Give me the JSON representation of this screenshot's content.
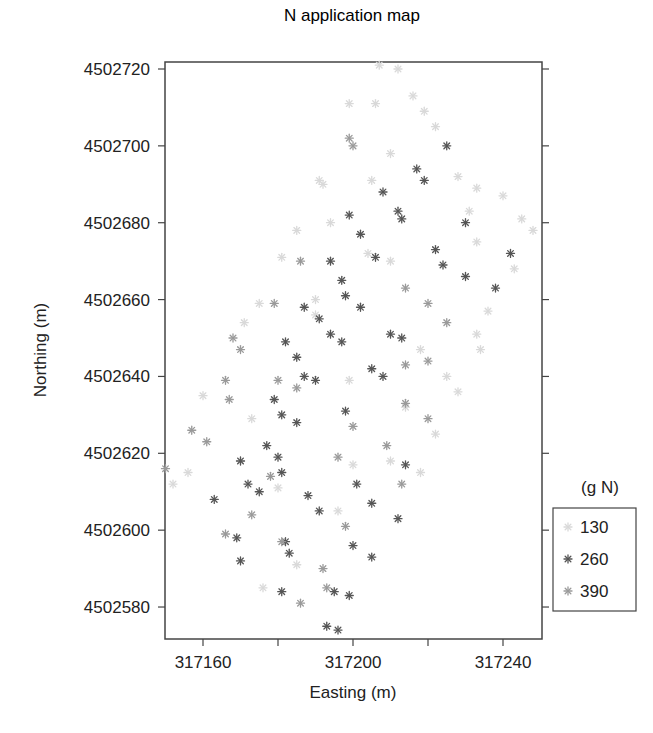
{
  "chart_data": {
    "type": "scatter",
    "title": "N application map",
    "xlabel": "Easting (m)",
    "ylabel": "Northing (m)",
    "xlim": [
      317150,
      317251
    ],
    "ylim": [
      4502572,
      4502722
    ],
    "xticks": [
      317160,
      317180,
      317200,
      317220,
      317240
    ],
    "xtick_labels": [
      "317160",
      "",
      "317200",
      "",
      "317240"
    ],
    "yticks": [
      4502580,
      4502600,
      4502620,
      4502640,
      4502660,
      4502680,
      4502700,
      4502720
    ],
    "ytick_labels": [
      "4502580",
      "4502600",
      "4502620",
      "4502640",
      "4502660",
      "4502680",
      "4502700",
      "4502720"
    ],
    "grid": false,
    "marker": "asterisk",
    "legend": {
      "title": "(g N)",
      "position": "right",
      "entries": [
        {
          "label": "130",
          "color": "#d9d9d9"
        },
        {
          "label": "260",
          "color": "#555555"
        },
        {
          "label": "390",
          "color": "#9a9a9a"
        }
      ]
    },
    "series": [
      {
        "name": "130",
        "color": "#d9d9d9",
        "points": [
          [
            317207,
            4502721
          ],
          [
            317212,
            4502720
          ],
          [
            317199,
            4502711
          ],
          [
            317206,
            4502711
          ],
          [
            317216,
            4502713
          ],
          [
            317219,
            4502709
          ],
          [
            317222,
            4502705
          ],
          [
            317228,
            4502692
          ],
          [
            317233,
            4502689
          ],
          [
            317240,
            4502687
          ],
          [
            317231,
            4502683
          ],
          [
            317233,
            4502675
          ],
          [
            317245,
            4502681
          ],
          [
            317248,
            4502678
          ],
          [
            317243,
            4502668
          ],
          [
            317236,
            4502657
          ],
          [
            317233,
            4502651
          ],
          [
            317234,
            4502647
          ],
          [
            317228,
            4502636
          ],
          [
            317222,
            4502625
          ],
          [
            317218,
            4502615
          ],
          [
            317210,
            4502618
          ],
          [
            317200,
            4502617
          ],
          [
            317196,
            4502605
          ],
          [
            317180,
            4502611
          ],
          [
            317176,
            4502585
          ],
          [
            317185,
            4502591
          ],
          [
            317191,
            4502691
          ],
          [
            317192,
            4502690
          ],
          [
            317205,
            4502691
          ],
          [
            317210,
            4502698
          ],
          [
            317194,
            4502680
          ],
          [
            317185,
            4502678
          ],
          [
            317181,
            4502671
          ],
          [
            317175,
            4502659
          ],
          [
            317171,
            4502654
          ],
          [
            317190,
            4502660
          ],
          [
            317190,
            4502656
          ],
          [
            317204,
            4502672
          ],
          [
            317210,
            4502670
          ],
          [
            317156,
            4502615
          ],
          [
            317160,
            4502635
          ],
          [
            317173,
            4502629
          ],
          [
            317170,
            4502618
          ],
          [
            317152,
            4502612
          ],
          [
            317199,
            4502639
          ],
          [
            317214,
            4502632
          ],
          [
            317218,
            4502647
          ],
          [
            317225,
            4502640
          ]
        ]
      },
      {
        "name": "260",
        "color": "#555555",
        "points": [
          [
            317225,
            4502700
          ],
          [
            317217,
            4502694
          ],
          [
            317219,
            4502691
          ],
          [
            317208,
            4502688
          ],
          [
            317212,
            4502683
          ],
          [
            317213,
            4502681
          ],
          [
            317199,
            4502682
          ],
          [
            317202,
            4502677
          ],
          [
            317206,
            4502671
          ],
          [
            317222,
            4502673
          ],
          [
            317224,
            4502669
          ],
          [
            317230,
            4502680
          ],
          [
            317238,
            4502663
          ],
          [
            317242,
            4502672
          ],
          [
            317230,
            4502666
          ],
          [
            317194,
            4502670
          ],
          [
            317197,
            4502665
          ],
          [
            317198,
            4502661
          ],
          [
            317202,
            4502658
          ],
          [
            317187,
            4502658
          ],
          [
            317191,
            4502655
          ],
          [
            317194,
            4502651
          ],
          [
            317197,
            4502649
          ],
          [
            317182,
            4502649
          ],
          [
            317185,
            4502645
          ],
          [
            317187,
            4502640
          ],
          [
            317190,
            4502639
          ],
          [
            317210,
            4502651
          ],
          [
            317213,
            4502650
          ],
          [
            317205,
            4502642
          ],
          [
            317208,
            4502640
          ],
          [
            317179,
            4502634
          ],
          [
            317181,
            4502630
          ],
          [
            317185,
            4502628
          ],
          [
            317177,
            4502622
          ],
          [
            317180,
            4502619
          ],
          [
            317181,
            4502615
          ],
          [
            317170,
            4502618
          ],
          [
            317172,
            4502612
          ],
          [
            317175,
            4502610
          ],
          [
            317163,
            4502608
          ],
          [
            317169,
            4502598
          ],
          [
            317170,
            4502592
          ],
          [
            317188,
            4502609
          ],
          [
            317191,
            4502605
          ],
          [
            317201,
            4502612
          ],
          [
            317205,
            4502607
          ],
          [
            317212,
            4502603
          ],
          [
            317214,
            4502617
          ],
          [
            317198,
            4502631
          ],
          [
            317200,
            4502596
          ],
          [
            317205,
            4502593
          ],
          [
            317182,
            4502597
          ],
          [
            317183,
            4502594
          ],
          [
            317181,
            4502584
          ],
          [
            317195,
            4502584
          ],
          [
            317199,
            4502583
          ],
          [
            317193,
            4502575
          ],
          [
            317196,
            4502574
          ]
        ]
      },
      {
        "name": "390",
        "color": "#9a9a9a",
        "points": [
          [
            317200,
            4502700
          ],
          [
            317199,
            4502702
          ],
          [
            317186,
            4502670
          ],
          [
            317214,
            4502663
          ],
          [
            317220,
            4502659
          ],
          [
            317225,
            4502654
          ],
          [
            317214,
            4502633
          ],
          [
            317220,
            4502629
          ],
          [
            317209,
            4502622
          ],
          [
            317213,
            4502612
          ],
          [
            317168,
            4502650
          ],
          [
            317170,
            4502647
          ],
          [
            317180,
            4502639
          ],
          [
            317166,
            4502639
          ],
          [
            317167,
            4502634
          ],
          [
            317179,
            4502659
          ],
          [
            317157,
            4502626
          ],
          [
            317161,
            4502623
          ],
          [
            317150,
            4502616
          ],
          [
            317196,
            4502619
          ],
          [
            317200,
            4502627
          ],
          [
            317185,
            4502637
          ],
          [
            317178,
            4502614
          ],
          [
            317173,
            4502604
          ],
          [
            317166,
            4502599
          ],
          [
            317181,
            4502597
          ],
          [
            317186,
            4502581
          ],
          [
            317192,
            4502590
          ],
          [
            317193,
            4502585
          ],
          [
            317198,
            4502601
          ],
          [
            317214,
            4502643
          ],
          [
            317220,
            4502644
          ]
        ]
      }
    ]
  }
}
